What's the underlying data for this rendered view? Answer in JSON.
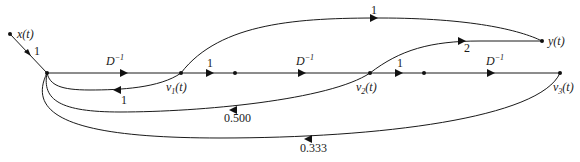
{
  "diagram": {
    "type": "signal-flow-graph",
    "nodes": {
      "input": {
        "label": "x(t)"
      },
      "output": {
        "label": "y(t)"
      },
      "v1": {
        "label_main": "v",
        "label_sub": "1",
        "label_arg": "(t)"
      },
      "v2": {
        "label_main": "v",
        "label_sub": "2",
        "label_arg": "(t)"
      },
      "v3": {
        "label_main": "v",
        "label_sub": "3",
        "label_arg": "(t)"
      }
    },
    "edges": {
      "input_gain": "1",
      "delay_1": {
        "base": "D",
        "exp": "−1"
      },
      "v1_forward_gain": "1",
      "delay_2": {
        "base": "D",
        "exp": "−1"
      },
      "v2_forward_gain": "1",
      "delay_3": {
        "base": "D",
        "exp": "−1"
      },
      "v1_to_output_gain": "1",
      "v2_to_output_gain": "2",
      "v1_feedback_gain": "1",
      "v2_feedback_gain": "0.500",
      "v3_feedback_gain": "0.333"
    }
  }
}
